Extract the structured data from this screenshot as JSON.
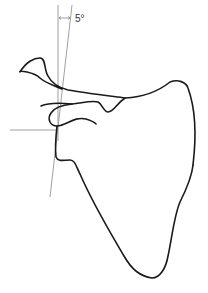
{
  "figure": {
    "angle_label": "5°",
    "colors": {
      "outline": "#1a1a1a",
      "reference_lines": "#888888",
      "background": "#ffffff"
    }
  }
}
